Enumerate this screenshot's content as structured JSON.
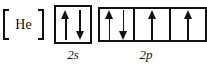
{
  "diagram": {
    "type": "orbital-filling-diagram",
    "core": {
      "symbol": "He",
      "bracket_open": "[",
      "bracket_close": "]"
    },
    "subshells": [
      {
        "id": "2s",
        "label": "2s",
        "box_count": 1,
        "boxes": [
          {
            "electrons": [
              "up",
              "down"
            ]
          }
        ]
      },
      {
        "id": "2p",
        "label": "2p",
        "box_count": 3,
        "boxes": [
          {
            "electrons": [
              "up",
              "down"
            ]
          },
          {
            "electrons": [
              "up"
            ]
          },
          {
            "electrons": [
              "up"
            ]
          }
        ]
      }
    ],
    "colors": {
      "ink": "#111111",
      "background": "#ffffff"
    }
  }
}
